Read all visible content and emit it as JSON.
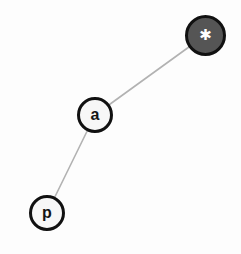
{
  "canvas": {
    "width": 241,
    "height": 254,
    "background_color": "#fdfdfd"
  },
  "graph": {
    "edge_color": "#b2b2b2",
    "edge_width": 1.6,
    "nodes": [
      {
        "id": "star",
        "label": "✱",
        "icon_name": "asterisk-star-icon",
        "cx": 205.5,
        "cy": 35,
        "r": 20.5,
        "fill_color": "#555555",
        "stroke_color": "#111111",
        "stroke_width": 3.6,
        "label_color": "#ffffff",
        "font_size": 15
      },
      {
        "id": "a",
        "label": "a",
        "icon_name": "letter-a-node",
        "cx": 95,
        "cy": 115,
        "r": 18,
        "fill_color": "#f7f7f7",
        "stroke_color": "#111111",
        "stroke_width": 3.4,
        "label_color": "#141414",
        "font_size": 16
      },
      {
        "id": "p",
        "label": "p",
        "icon_name": "letter-p-node",
        "cx": 47,
        "cy": 213,
        "r": 18,
        "fill_color": "#f7f7f7",
        "stroke_color": "#111111",
        "stroke_width": 3.4,
        "label_color": "#141414",
        "font_size": 16
      }
    ],
    "edges": [
      {
        "id": "edge-a-star",
        "source": "a",
        "target": "star",
        "x1": 95,
        "y1": 115,
        "x2": 205.5,
        "y2": 35
      },
      {
        "id": "edge-p-a",
        "source": "p",
        "target": "a",
        "x1": 47,
        "y1": 213,
        "x2": 95,
        "y2": 115
      }
    ]
  },
  "chart_data": {
    "type": "diagram",
    "title": "",
    "nodes": [
      "p",
      "a",
      "*"
    ],
    "edges": [
      [
        "p",
        "a"
      ],
      [
        "a",
        "*"
      ]
    ],
    "layout": "node-link"
  }
}
